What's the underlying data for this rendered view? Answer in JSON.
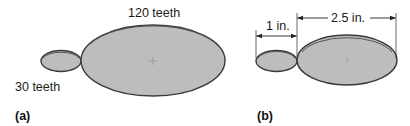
{
  "figure_a": {
    "label": "(a)",
    "large_gear_label": "120 teeth",
    "small_gear_label": "30 teeth"
  },
  "figure_b": {
    "label": "(b)",
    "small_diameter_label": "1 in.",
    "large_diameter_label": "2.5 in."
  },
  "colors": {
    "gear_fill": "#bdbdbd",
    "gear_outline": "#3a3a3a",
    "text": "#1a1a1a"
  }
}
